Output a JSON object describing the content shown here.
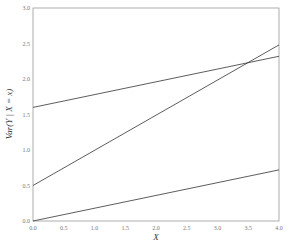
{
  "chart_data": {
    "type": "line",
    "title": "",
    "xlabel": "X",
    "ylabel": "Var(Y | X = x)",
    "xlim": [
      0.0,
      4.0
    ],
    "ylim": [
      0.0,
      3.0
    ],
    "grid": false,
    "legend": null,
    "x_ticks": [
      "0.0",
      "0.5",
      "1.0",
      "1.5",
      "2.0",
      "2.5",
      "3.0",
      "3.5",
      "4.0"
    ],
    "y_ticks": [
      "0.0",
      "0.5",
      "1.0",
      "1.5",
      "2.0",
      "2.5",
      "3.0"
    ],
    "x": [
      0.0,
      4.0
    ],
    "series": [
      {
        "name": "line-1",
        "values": [
          1.6,
          2.32
        ],
        "color": "#333333"
      },
      {
        "name": "line-2",
        "values": [
          0.5,
          2.48
        ],
        "color": "#333333"
      },
      {
        "name": "line-3",
        "values": [
          0.0,
          0.72
        ],
        "color": "#333333"
      }
    ]
  },
  "frame_color": "#999999"
}
